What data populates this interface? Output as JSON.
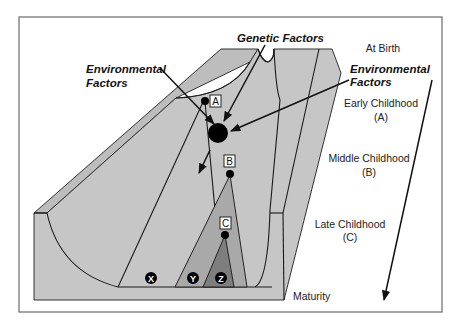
{
  "diagram": {
    "factor_labels": {
      "genetic": "Genetic Factors",
      "environmental_left_line1": "Environmental",
      "environmental_left_line2": "Factors",
      "environmental_right_line1": "Environmental",
      "environmental_right_line2": "Factors"
    },
    "stages": [
      {
        "id": "birth",
        "line1": "At Birth",
        "line2": ""
      },
      {
        "id": "early",
        "line1": "Early Childhood",
        "line2": "(A)"
      },
      {
        "id": "middle",
        "line1": "Middle Childhood",
        "line2": "(B)"
      },
      {
        "id": "late",
        "line1": "Late Childhood",
        "line2": "(C)"
      },
      {
        "id": "maturity",
        "line1": "Maturity",
        "line2": ""
      }
    ],
    "branch_points": [
      {
        "label": "A"
      },
      {
        "label": "B"
      },
      {
        "label": "C"
      }
    ],
    "outcomes": [
      {
        "label": "X"
      },
      {
        "label": "Y"
      },
      {
        "label": "Z"
      }
    ],
    "colors": {
      "slab": "#c6c6c6",
      "slab_top": "#bdbdbd",
      "valley_b": "#a9a9a9",
      "valley_c": "#7e7e7e",
      "ball": "#000000",
      "frame": "#6b6b6b"
    }
  }
}
